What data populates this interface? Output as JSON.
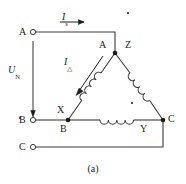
{
  "figure": {
    "caption": "(a)",
    "terminals": [
      {
        "label": "A"
      },
      {
        "label": "B"
      },
      {
        "label": "C"
      }
    ],
    "phasors": {
      "line_current": {
        "base": "I",
        "sub": "s"
      },
      "phase_current": {
        "base": "I",
        "sub": "△"
      },
      "voltage": {
        "base": "U",
        "sub": "N"
      }
    },
    "winding_nodes": {
      "apex_left": "A",
      "apex_right": "Z",
      "left_upper": "X",
      "left_lower": "B",
      "bottom_right_inner": "Y",
      "right_vertex": "C"
    },
    "colors": {
      "wire": "#3a3a3a",
      "text": "#1a1a1a",
      "background": "#ffffff"
    }
  }
}
